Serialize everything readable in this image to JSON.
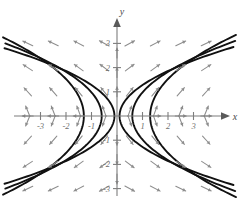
{
  "figure": {
    "title": "",
    "axis_labels": {
      "x": "x",
      "y": "y"
    },
    "background": "#ffffff"
  },
  "colors": {
    "axis": "#7d7d7d",
    "tick_label": "#6e6e6e",
    "slope_arrow": "#8d8d8d",
    "curve": "#111111"
  },
  "chart_data": {
    "type": "line",
    "title": "",
    "xlabel": "x",
    "ylabel": "y",
    "xlim": [
      -4.2,
      4.4
    ],
    "ylim": [
      -3.7,
      3.6
    ],
    "grid": false,
    "legend": null,
    "x_ticks": [
      -3,
      -2,
      -1,
      1,
      2,
      3
    ],
    "x_tick_labels": [
      "-3",
      "-2",
      "-1",
      "1",
      "2",
      "3"
    ],
    "y_ticks": [
      -3,
      -2,
      -1,
      1,
      2,
      3
    ],
    "y_tick_labels": [
      "-3",
      "-2",
      "-1",
      "1",
      "2",
      "3"
    ],
    "vector_field": {
      "name": "slope-field-arrows",
      "style": "arrow",
      "x_samples": [
        -3.5,
        -2.5,
        -1.5,
        -0.5,
        0.5,
        1.5,
        2.5,
        3.5
      ],
      "y_samples": [
        -3,
        -2,
        -1,
        -0.2,
        0.2,
        1,
        2,
        3
      ],
      "rule": "arrows point away from the y-axis horizontally and follow the local slope of the parabolas; on the y-axis arrows are vertical"
    },
    "series": [
      {
        "name": "right-branch-vertex-0.1",
        "side": "right",
        "vertex_x": 0.1,
        "width_k": 0.55,
        "values_x": [
          0.1,
          0.35,
          0.85,
          1.6,
          2.6,
          3.9
        ],
        "values_y": [
          0.0,
          0.67,
          1.14,
          1.58,
          2.02,
          2.48
        ]
      },
      {
        "name": "right-branch-vertex-0.6",
        "side": "right",
        "vertex_x": 0.6,
        "width_k": 0.42,
        "values_x": [
          0.6,
          0.85,
          1.35,
          2.1,
          3.1,
          4.2
        ],
        "values_y": [
          0.0,
          0.77,
          1.34,
          1.88,
          2.43,
          2.9
        ]
      },
      {
        "name": "right-branch-vertex-1.3",
        "side": "right",
        "vertex_x": 1.3,
        "width_k": 0.3,
        "values_x": [
          1.3,
          1.6,
          2.1,
          2.9,
          4.0,
          4.4
        ],
        "values_y": [
          0.0,
          1.0,
          1.63,
          2.31,
          3.0,
          3.16
        ]
      },
      {
        "name": "left-branch-vertex--0.1",
        "side": "left",
        "vertex_x": -0.1,
        "width_k": 0.55,
        "values_x": [
          -0.1,
          -0.35,
          -0.85,
          -1.6,
          -2.6,
          -3.9
        ],
        "values_y": [
          0.0,
          0.67,
          1.14,
          1.58,
          2.02,
          2.48
        ]
      },
      {
        "name": "left-branch-vertex--0.6",
        "side": "left",
        "vertex_x": -0.6,
        "width_k": 0.42,
        "values_x": [
          -0.6,
          -0.85,
          -1.35,
          -2.1,
          -3.1,
          -4.2
        ],
        "values_y": [
          0.0,
          0.77,
          1.34,
          1.88,
          2.43,
          2.9
        ]
      },
      {
        "name": "left-branch-vertex--1.3",
        "side": "left",
        "vertex_x": -1.3,
        "width_k": 0.3,
        "values_x": [
          -1.3,
          -1.6,
          -2.1,
          -2.9,
          -4.0,
          -4.4
        ],
        "values_y": [
          0.0,
          1.0,
          1.63,
          2.31,
          3.0,
          3.16
        ]
      }
    ]
  }
}
